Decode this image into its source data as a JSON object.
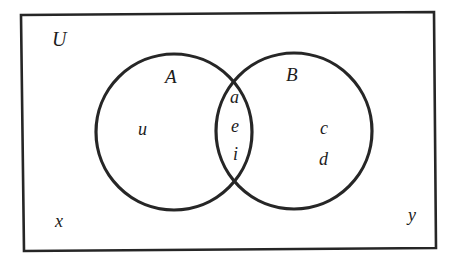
{
  "diagram": {
    "type": "venn",
    "universe": {
      "label": "U",
      "outside_elements": [
        "x",
        "y"
      ]
    },
    "sets": [
      {
        "label": "A",
        "only_elements": [
          "u"
        ]
      },
      {
        "label": "B",
        "only_elements": [
          "c",
          "d"
        ]
      }
    ],
    "intersection": {
      "sets": [
        "A",
        "B"
      ],
      "elements": [
        "a",
        "e",
        "i"
      ]
    },
    "colors": {
      "stroke": "#262626",
      "text": "#1c1c1c",
      "background": "#ffffff"
    }
  }
}
